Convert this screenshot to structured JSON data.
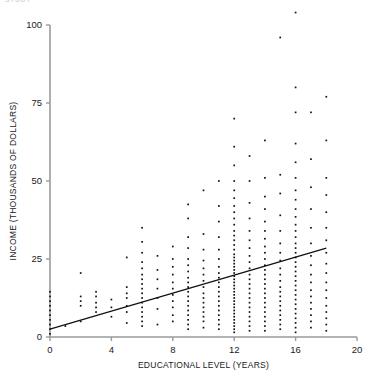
{
  "figure": {
    "cut_off_header": "STUDY",
    "background_color": "#ffffff",
    "point_color": "#111111",
    "line_color": "#111111",
    "axis_color": "#9a9a9a"
  },
  "chart_data": {
    "type": "scatter",
    "title": "",
    "xlabel": "EDUCATIONAL LEVEL (YEARS)",
    "ylabel": "INCOME (THOUSANDS OF DOLLARS)",
    "xlim": [
      0,
      20
    ],
    "ylim": [
      0,
      108
    ],
    "xticks": [
      0,
      4,
      8,
      12,
      16,
      20
    ],
    "xticklabels": [
      "0",
      "4",
      "8",
      "12",
      "16",
      "20"
    ],
    "yticks": [
      0,
      25,
      50,
      75,
      100
    ],
    "yticklabels": [
      "0",
      "25",
      "50",
      "75",
      "100"
    ],
    "grid": false,
    "legend": null,
    "minor_xticks": [
      1,
      2,
      3,
      5,
      6,
      7,
      9,
      10,
      11,
      13,
      14,
      15,
      17,
      18,
      19
    ],
    "regression_line": {
      "x_start": 0,
      "y_start": 2.5,
      "x_end": 18,
      "y_end": 28.5,
      "slope": 1.44,
      "intercept": 2.5
    },
    "series": [
      {
        "name": "individuals",
        "marker": "square",
        "marker_size": 1.7,
        "columns": [
          {
            "x": 0,
            "values": [
              1,
              2.5,
              4,
              5.5,
              7,
              8.5,
              10,
              11.5,
              13,
              14.5
            ]
          },
          {
            "x": 1,
            "values": [
              3.5
            ]
          },
          {
            "x": 2,
            "values": [
              5,
              10,
              11.5,
              13,
              20.5
            ]
          },
          {
            "x": 3,
            "values": [
              8,
              9.5,
              11,
              13,
              14.5
            ]
          },
          {
            "x": 4,
            "values": [
              6.5,
              9.5,
              12
            ]
          },
          {
            "x": 5,
            "values": [
              4.5,
              8,
              10,
              12.5,
              14,
              16,
              25.5
            ]
          },
          {
            "x": 6,
            "values": [
              3.5,
              5,
              6.5,
              8,
              9.5,
              11,
              12.5,
              14,
              15.5,
              17,
              18.5,
              20,
              22,
              24,
              27,
              30.5,
              35
            ]
          },
          {
            "x": 7,
            "values": [
              4,
              9,
              12.5,
              15.5,
              18.5,
              21.5,
              26
            ]
          },
          {
            "x": 8,
            "values": [
              5,
              7,
              9.5,
              11.5,
              13.5,
              15.5,
              17.5,
              20,
              22.5,
              25,
              29
            ]
          },
          {
            "x": 9,
            "values": [
              2.5,
              4,
              5.5,
              7,
              8.5,
              10,
              11.5,
              13,
              14.5,
              16,
              17.5,
              19,
              21,
              23,
              25,
              28.5,
              32,
              38,
              42.5
            ]
          },
          {
            "x": 10,
            "values": [
              3,
              5,
              6.5,
              8,
              9.5,
              11,
              12.5,
              14,
              16,
              18,
              20,
              22,
              24.5,
              28,
              33,
              47
            ]
          },
          {
            "x": 11,
            "values": [
              2.5,
              4,
              5.5,
              7,
              8.5,
              10,
              11.5,
              13,
              14.5,
              16,
              17.5,
              19,
              20.5,
              22.5,
              25,
              28,
              32,
              37,
              42,
              50
            ]
          },
          {
            "x": 12,
            "values": [
              1.5,
              2.5,
              3.5,
              4.5,
              5.5,
              6.5,
              7.5,
              8.5,
              9.5,
              10.5,
              11.5,
              12.5,
              13.5,
              14.5,
              15.5,
              16.5,
              17.5,
              18.5,
              19.5,
              20.5,
              21.5,
              22.5,
              23.5,
              24.5,
              25.5,
              26.5,
              28,
              29.5,
              31,
              32.5,
              34,
              36,
              38,
              40,
              42,
              44.5,
              47,
              50,
              55,
              61,
              70
            ]
          },
          {
            "x": 13,
            "values": [
              2,
              3.5,
              5,
              6.5,
              8,
              9.5,
              11,
              12.5,
              14,
              15.5,
              17,
              18.5,
              20,
              22,
              24,
              26,
              28.5,
              31,
              34,
              38,
              43,
              50,
              58
            ]
          },
          {
            "x": 14,
            "values": [
              2,
              3.5,
              5,
              6.5,
              8,
              9.5,
              11,
              12.5,
              14,
              15.5,
              17,
              18.5,
              20,
              21.5,
              23,
              25,
              27,
              29,
              31.5,
              34,
              37,
              41,
              45,
              51,
              63
            ]
          },
          {
            "x": 15,
            "values": [
              2.5,
              4,
              5.5,
              7,
              8.5,
              10,
              11.5,
              13,
              14.5,
              16,
              18,
              20,
              22,
              24.5,
              27,
              30,
              34,
              39,
              46,
              52,
              96
            ]
          },
          {
            "x": 16,
            "values": [
              1.5,
              3,
              4.5,
              6,
              7.5,
              9,
              10.5,
              12,
              13.5,
              15,
              16.5,
              18,
              19.5,
              21,
              22.5,
              24,
              25.5,
              27,
              28.5,
              30,
              32,
              34,
              36,
              38.5,
              41,
              44,
              47,
              51,
              56,
              62,
              72,
              80,
              104
            ]
          },
          {
            "x": 17,
            "values": [
              3,
              5,
              7,
              9,
              11,
              13,
              15,
              17.5,
              20,
              23,
              26,
              30,
              35,
              41,
              48,
              57,
              72
            ]
          },
          {
            "x": 18,
            "values": [
              2,
              4,
              6,
              8,
              10,
              12.5,
              15,
              17.5,
              20.5,
              23.5,
              27,
              31,
              35,
              40,
              45.5,
              51,
              63,
              77
            ]
          }
        ]
      }
    ]
  }
}
